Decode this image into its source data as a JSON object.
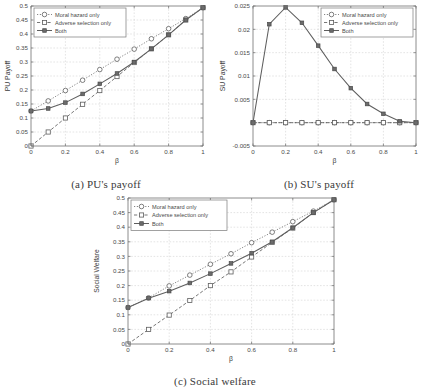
{
  "figure": {
    "background": "#ffffff",
    "line_color": "#5e5e5e",
    "grid_color": "#c9c9c9",
    "axis_color": "#6e6e6e"
  },
  "legend": {
    "entries": [
      {
        "label": "Moral hazard only",
        "style": "dotted",
        "marker": "circle"
      },
      {
        "label": "Adverse selection only",
        "style": "dashed",
        "marker": "square"
      },
      {
        "label": "Both",
        "style": "solid",
        "marker": "filled-square"
      }
    ]
  },
  "panels": [
    {
      "id": "a",
      "caption": "(a) PU's payoff",
      "chart_data": {
        "type": "line",
        "title": "",
        "xlabel": "β",
        "ylabel": "PU Payoff",
        "xlim": [
          0,
          1
        ],
        "ylim": [
          0,
          0.5
        ],
        "xticks": [
          0,
          0.2,
          0.4,
          0.6,
          0.8,
          1
        ],
        "xtick_labels": [
          "0",
          "0.2",
          "0.4",
          "0.6",
          "0.8",
          "1"
        ],
        "yticks": [
          0,
          0.05,
          0.1,
          0.15,
          0.2,
          0.25,
          0.3,
          0.35,
          0.4,
          0.45,
          0.5
        ],
        "ytick_labels": [
          "0",
          "0.05",
          "0.1",
          "0.15",
          "0.2",
          "0.25",
          "0.3",
          "0.35",
          "0.4",
          "0.45",
          "0.5"
        ],
        "grid": true,
        "legend_position": "top-left",
        "x": [
          0,
          0.1,
          0.2,
          0.3,
          0.4,
          0.5,
          0.6,
          0.7,
          0.8,
          0.9,
          1
        ],
        "series": [
          {
            "name": "Moral hazard only",
            "style": "dotted",
            "marker": "circle",
            "values": [
              0.125,
              0.161,
              0.198,
              0.235,
              0.273,
              0.31,
              0.346,
              0.383,
              0.419,
              0.455,
              0.494
            ]
          },
          {
            "name": "Adverse selection only",
            "style": "dashed",
            "marker": "square",
            "values": [
              0.0,
              0.05,
              0.1,
              0.149,
              0.198,
              0.248,
              0.298,
              0.347,
              0.397,
              0.45,
              0.494
            ]
          },
          {
            "name": "Both",
            "style": "solid",
            "marker": "filled-square",
            "values": [
              0.125,
              0.134,
              0.155,
              0.186,
              0.222,
              0.259,
              0.3,
              0.347,
              0.397,
              0.45,
              0.494
            ]
          }
        ]
      }
    },
    {
      "id": "b",
      "caption": "(b) SU's payoff",
      "chart_data": {
        "type": "line",
        "title": "",
        "xlabel": "β",
        "ylabel": "SU Payoff",
        "xlim": [
          0,
          1
        ],
        "ylim": [
          -0.005,
          0.025
        ],
        "xticks": [
          0,
          0.2,
          0.4,
          0.6,
          0.8,
          1
        ],
        "xtick_labels": [
          "0",
          "0.2",
          "0.4",
          "0.6",
          "0.8",
          "1"
        ],
        "yticks": [
          -0.005,
          0,
          0.005,
          0.01,
          0.015,
          0.02,
          0.025
        ],
        "ytick_labels": [
          "-0.005",
          "",
          "0.005",
          "0.01",
          "0.015",
          "0.02",
          "0.025"
        ],
        "grid": true,
        "legend_position": "top-right",
        "x": [
          0,
          0.1,
          0.2,
          0.3,
          0.4,
          0.5,
          0.6,
          0.7,
          0.8,
          0.9,
          1
        ],
        "series": [
          {
            "name": "Moral hazard only",
            "style": "dotted",
            "marker": "circle",
            "values": [
              0,
              0,
              0,
              0,
              0,
              0,
              0,
              0,
              0,
              0,
              0
            ]
          },
          {
            "name": "Adverse selection only",
            "style": "dashed",
            "marker": "square",
            "values": [
              0,
              0,
              0,
              0,
              0,
              0,
              0,
              0,
              0,
              0,
              0
            ]
          },
          {
            "name": "Both",
            "style": "solid",
            "marker": "filled-square",
            "values": [
              0.0,
              0.0211,
              0.0247,
              0.0214,
              0.0165,
              0.0115,
              0.0074,
              0.004,
              0.0019,
              0.0003,
              0.0
            ]
          }
        ]
      }
    },
    {
      "id": "c",
      "caption": "(c) Social welfare",
      "chart_data": {
        "type": "line",
        "title": "",
        "xlabel": "β",
        "ylabel": "Social Welfare",
        "xlim": [
          0,
          1
        ],
        "ylim": [
          0,
          0.5
        ],
        "xticks": [
          0,
          0.2,
          0.4,
          0.6,
          0.8,
          1
        ],
        "xtick_labels": [
          "0",
          "0.2",
          "0.4",
          "0.6",
          "0.8",
          "1"
        ],
        "yticks": [
          0,
          0.05,
          0.1,
          0.15,
          0.2,
          0.25,
          0.3,
          0.35,
          0.4,
          0.45,
          0.5
        ],
        "ytick_labels": [
          "0",
          "0.05",
          "0.1",
          "0.15",
          "0.2",
          "0.25",
          "0.3",
          "0.35",
          "0.4",
          "0.45",
          "0.5"
        ],
        "grid": true,
        "legend_position": "top-left",
        "x": [
          0,
          0.1,
          0.2,
          0.3,
          0.4,
          0.5,
          0.6,
          0.7,
          0.8,
          0.9,
          1
        ],
        "series": [
          {
            "name": "Moral hazard only",
            "style": "dotted",
            "marker": "circle",
            "values": [
              0.125,
              0.158,
              0.199,
              0.236,
              0.273,
              0.309,
              0.347,
              0.383,
              0.419,
              0.455,
              0.494
            ]
          },
          {
            "name": "Adverse selection only",
            "style": "dashed",
            "marker": "square",
            "values": [
              0.0,
              0.05,
              0.099,
              0.149,
              0.2,
              0.247,
              0.298,
              0.348,
              0.397,
              0.45,
              0.494
            ]
          },
          {
            "name": "Both",
            "style": "solid",
            "marker": "filled-square",
            "values": [
              0.125,
              0.157,
              0.181,
              0.209,
              0.241,
              0.276,
              0.311,
              0.35,
              0.398,
              0.45,
              0.494
            ]
          }
        ]
      }
    }
  ]
}
